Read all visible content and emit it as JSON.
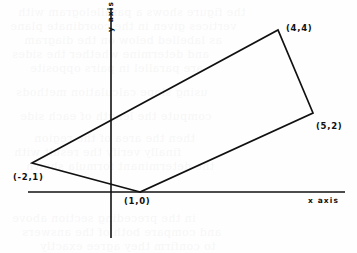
{
  "figure": {
    "kind": "coordinate-geometry-diagram",
    "background_color": "#fefefe",
    "ink_color": "#111111",
    "width": 357,
    "height": 253
  },
  "axes": {
    "x": {
      "label": "x axis",
      "label_x": 308,
      "label_y": 197,
      "line": {
        "x1": 28,
        "y1": 192,
        "x2": 345,
        "y2": 192
      },
      "stroke_width": 1.6
    },
    "y": {
      "label": "y axis",
      "label_x": 107,
      "label_y": 32,
      "line": {
        "x1": 111,
        "y1": 8,
        "x2": 111,
        "y2": 238
      },
      "stroke_width": 1.6
    },
    "origin": {
      "x": 111,
      "y": 192
    },
    "unit_px": {
      "x": 29,
      "y": 29
    }
  },
  "shape": {
    "name": "parallelogram",
    "stroke_width": 1.7,
    "fill": "none",
    "vertices": [
      {
        "label": "(1,0)",
        "data_x": 1,
        "data_y": 0,
        "px": 140,
        "py": 192,
        "label_px": 124,
        "label_py": 197
      },
      {
        "label": "(-2,1)",
        "data_x": -2,
        "data_y": 1,
        "px": 32,
        "py": 163,
        "label_px": 13,
        "label_py": 173
      },
      {
        "label": "(4,4)",
        "data_x": 4,
        "data_y": 4,
        "px": 278,
        "py": 30,
        "label_px": 286,
        "label_py": 24
      },
      {
        "label": "(5,2)",
        "data_x": 5,
        "data_y": 2,
        "px": 313,
        "py": 113,
        "label_px": 316,
        "label_py": 122
      }
    ],
    "edge_order": [
      0,
      1,
      2,
      3
    ],
    "polygon_points": "140,192 32,163 278,30 313,113"
  },
  "vertex_labels": [
    "(1,0)",
    "(-2,1)",
    "(4,4)",
    "(5,2)"
  ],
  "ghost_text": [
    {
      "text": "the figure shows a parallelogram with",
      "x": 18,
      "y": 6,
      "size": 11
    },
    {
      "text": "vertices given in the coordinate plane",
      "x": 10,
      "y": 20,
      "size": 11
    },
    {
      "text": "as labelled below on the diagram",
      "x": 24,
      "y": 34,
      "size": 11
    },
    {
      "text": "and determine whether the sides",
      "x": 12,
      "y": 48,
      "size": 11
    },
    {
      "text": "are parallel in pairs opposite",
      "x": 30,
      "y": 62,
      "size": 11
    },
    {
      "text": "using slope calculation methods",
      "x": 16,
      "y": 86,
      "size": 11
    },
    {
      "text": "compute the length of each side",
      "x": 20,
      "y": 110,
      "size": 11
    },
    {
      "text": "then the area of the region",
      "x": 34,
      "y": 132,
      "size": 11
    },
    {
      "text": "finally verify the result with",
      "x": 14,
      "y": 146,
      "size": 11
    },
    {
      "text": "the determinant formula shown",
      "x": 26,
      "y": 160,
      "size": 11
    },
    {
      "text": "in the preceding section above",
      "x": 12,
      "y": 212,
      "size": 11
    },
    {
      "text": "and compare both of the answers",
      "x": 22,
      "y": 226,
      "size": 11
    },
    {
      "text": "to confirm they agree exactly",
      "x": 40,
      "y": 240,
      "size": 11
    }
  ]
}
